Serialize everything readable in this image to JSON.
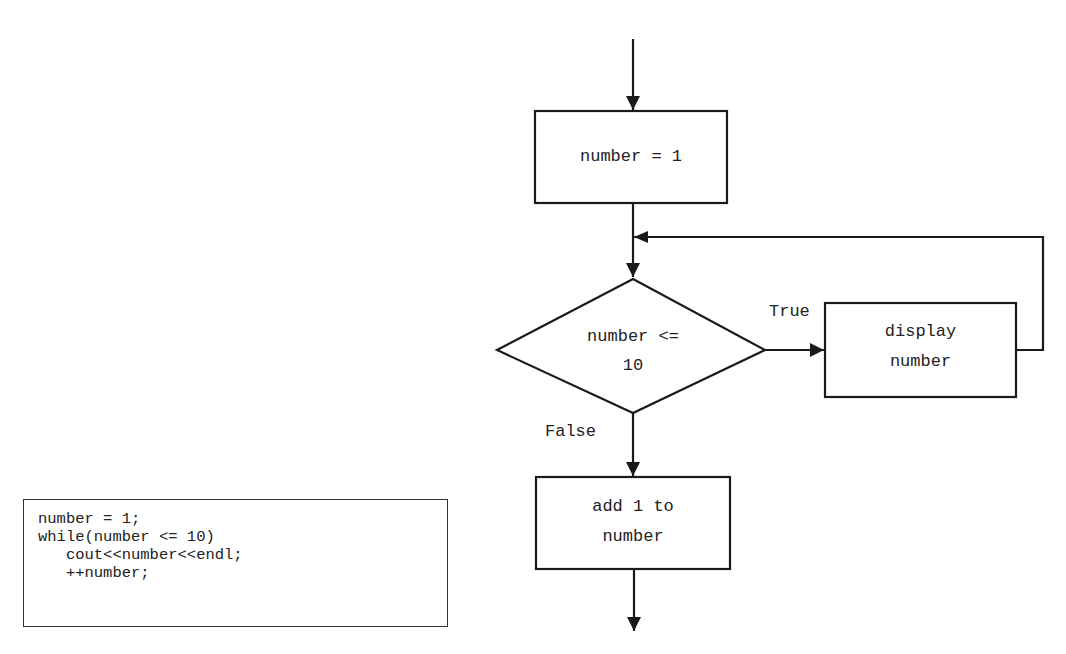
{
  "flowchart": {
    "nodes": {
      "init": {
        "type": "process",
        "lines": [
          "number = 1"
        ]
      },
      "condition": {
        "type": "decision",
        "lines": [
          "number <=",
          "10"
        ]
      },
      "display": {
        "type": "process",
        "lines": [
          "display",
          "number"
        ]
      },
      "increment": {
        "type": "process",
        "lines": [
          "add 1 to",
          "number"
        ]
      }
    },
    "edges": {
      "true_label": "True",
      "false_label": "False"
    }
  },
  "code": {
    "lines": [
      "number = 1;",
      "while(number <= 10)",
      "   cout<<number<<endl;",
      "   ++number;"
    ]
  },
  "colors": {
    "stroke": "#1a1a1a",
    "background": "#ffffff"
  }
}
